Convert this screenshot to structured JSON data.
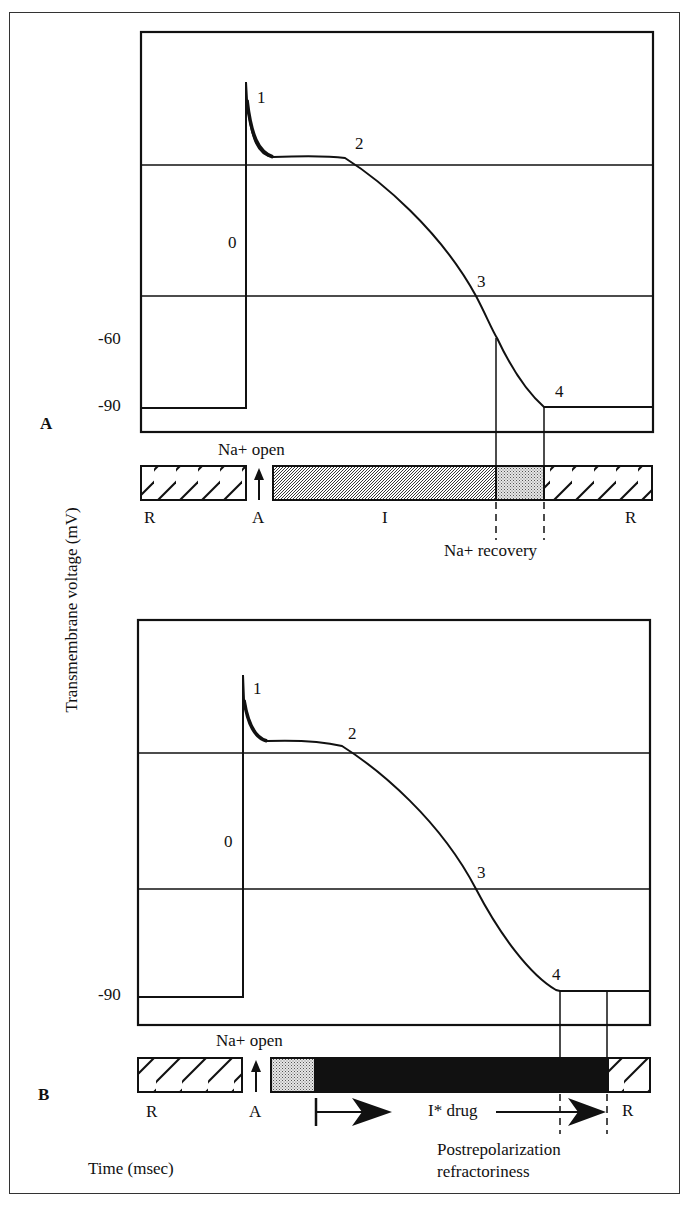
{
  "figure": {
    "y_axis_label": "Transmembrane voltage (mV)",
    "x_axis_label": "Time (msec)"
  },
  "panel_a": {
    "label": "A",
    "ticks": [
      "-60",
      "-90"
    ],
    "phases": [
      "0",
      "1",
      "2",
      "3",
      "4"
    ],
    "channel_label": "Na+ open",
    "bar_labels": {
      "resting_left": "R",
      "activated": "A",
      "inactivated": "I",
      "resting_right": "R"
    },
    "recovery_label": "Na+ recovery"
  },
  "panel_b": {
    "label": "B",
    "ticks": [
      "-90"
    ],
    "phases": [
      "0",
      "1",
      "2",
      "3",
      "4"
    ],
    "channel_label": "Na+ open",
    "bar_labels": {
      "resting_left": "R",
      "activated": "A",
      "inactivated_drug": "I* drug",
      "resting_right": "R"
    },
    "refractory_label_line1": "Postrepolarization",
    "refractory_label_line2": "refractoriness"
  },
  "colors": {
    "ink": "#111111",
    "stipple": "#bdbdbd",
    "background": "#ffffff"
  }
}
